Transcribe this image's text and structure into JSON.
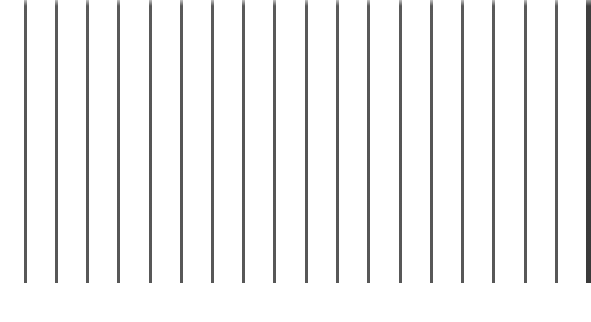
{
  "figure": {
    "bar_color": "#555555",
    "edge_bar_color": "#3a3a3a",
    "background_color": "#ffffff",
    "bar_top": 0,
    "bar_bottom": 283,
    "bar_width": 3,
    "bars": [
      {
        "x": 24
      },
      {
        "x": 55
      },
      {
        "x": 86
      },
      {
        "x": 117
      },
      {
        "x": 149
      },
      {
        "x": 180
      },
      {
        "x": 211
      },
      {
        "x": 242
      },
      {
        "x": 273
      },
      {
        "x": 305
      },
      {
        "x": 336
      },
      {
        "x": 367
      },
      {
        "x": 399
      },
      {
        "x": 430
      },
      {
        "x": 461
      },
      {
        "x": 492
      },
      {
        "x": 524
      },
      {
        "x": 555
      },
      {
        "x": 586,
        "edge": true
      }
    ]
  }
}
